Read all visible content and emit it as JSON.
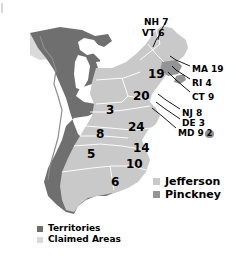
{
  "chart_data": {
    "type": "map",
    "legend_position": "right-bottom",
    "colors": {
      "jefferson": "#c9c9c9",
      "pinckney": "#949494",
      "territories": "#6f6f6f",
      "claimed_areas": "#d9d9d9",
      "water": "#ffffff",
      "border": "#ffffff",
      "text": "#000000"
    },
    "series": [
      {
        "name": "Jefferson",
        "color": "#c9c9c9"
      },
      {
        "name": "Pinckney",
        "color": "#949494"
      }
    ],
    "categories": [
      "NH",
      "VT",
      "MA",
      "RI",
      "CT",
      "NY",
      "PA",
      "NJ",
      "DE",
      "MD",
      "OH",
      "VA",
      "NC",
      "SC",
      "GA",
      "KY",
      "TN"
    ],
    "values": [
      7,
      6,
      19,
      4,
      9,
      19,
      20,
      8,
      3,
      9,
      3,
      24,
      14,
      10,
      6,
      8,
      5
    ],
    "annotations": [
      "MD 9 with 2 electoral votes to Pinckney"
    ]
  },
  "map": {
    "state_labels": [
      {
        "id": "ny",
        "value": "19",
        "x": 148,
        "y": 68,
        "size": 12
      },
      {
        "id": "pa",
        "value": "20",
        "x": 133,
        "y": 90,
        "size": 12
      },
      {
        "id": "oh",
        "value": "3",
        "x": 106,
        "y": 104,
        "size": 12
      },
      {
        "id": "va",
        "value": "24",
        "x": 128,
        "y": 121,
        "size": 12
      },
      {
        "id": "ky",
        "value": "8",
        "x": 96,
        "y": 128,
        "size": 12
      },
      {
        "id": "tn",
        "value": "5",
        "x": 87,
        "y": 148,
        "size": 12
      },
      {
        "id": "nc",
        "value": "14",
        "x": 133,
        "y": 142,
        "size": 12
      },
      {
        "id": "sc",
        "value": "10",
        "x": 126,
        "y": 158,
        "size": 12
      },
      {
        "id": "ga",
        "value": "6",
        "x": 111,
        "y": 176,
        "size": 12
      }
    ],
    "callouts": [
      {
        "id": "nh",
        "label": "NH 7",
        "x": 144,
        "y": 18
      },
      {
        "id": "vt",
        "label": "VT 6",
        "x": 142,
        "y": 29
      },
      {
        "id": "ma",
        "label": "MA 19",
        "x": 192,
        "y": 65
      },
      {
        "id": "ri",
        "label": "RI 4",
        "x": 192,
        "y": 79
      },
      {
        "id": "ct",
        "label": "CT 9",
        "x": 192,
        "y": 93
      },
      {
        "id": "nj",
        "label": "NJ 8",
        "x": 182,
        "y": 109
      },
      {
        "id": "de",
        "label": "DE 3",
        "x": 182,
        "y": 119
      },
      {
        "id": "md",
        "label": "MD 9",
        "x": 178,
        "y": 129,
        "badge": "2"
      }
    ]
  },
  "legends": {
    "candidates": {
      "items": [
        {
          "label": "Jefferson",
          "color": "#c9c9c9"
        },
        {
          "label": "Pinckney",
          "color": "#949494"
        }
      ]
    },
    "areas": {
      "items": [
        {
          "label": "Territories",
          "color": "#6f6f6f"
        },
        {
          "label": "Claimed Areas",
          "color": "#d9d9d9"
        }
      ]
    }
  }
}
